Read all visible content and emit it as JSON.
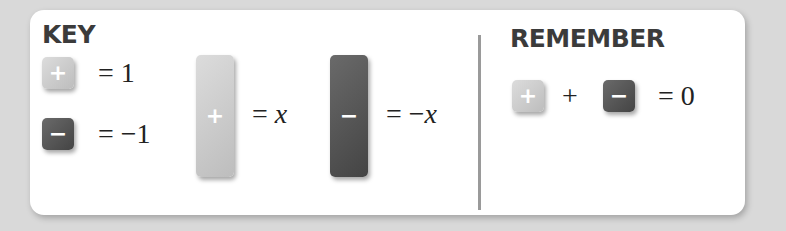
{
  "key": {
    "heading": "KEY",
    "unit_positive": {
      "symbol": "+",
      "equals": "= 1",
      "color": "#c8c8c8"
    },
    "unit_negative": {
      "symbol": "−",
      "equals": "= −1",
      "color": "#555555"
    },
    "x_positive": {
      "symbol": "+",
      "equals": "= x"
    },
    "x_negative": {
      "symbol": "−",
      "equals": "= −x"
    }
  },
  "remember": {
    "heading": "REMEMBER",
    "tile_positive": "+",
    "operator": "+",
    "tile_negative": "−",
    "result": "= 0"
  }
}
